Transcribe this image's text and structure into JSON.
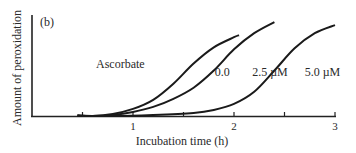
{
  "chart_data": {
    "type": "line",
    "panel_label": "(b)",
    "title": "",
    "xlabel": "Incubation time (h)",
    "ylabel": "Amount of peroxidation",
    "xlim": [
      0,
      3
    ],
    "ylim": [
      0,
      100
    ],
    "x_ticks": [
      0.5,
      1,
      1.5,
      2,
      2.5,
      3
    ],
    "x_tick_labels": [
      {
        "value": 1,
        "label": "1"
      },
      {
        "value": 2,
        "label": "2"
      },
      {
        "value": 3,
        "label": "3"
      }
    ],
    "y_ticks": [],
    "grid": false,
    "legend_title": "Ascorbate",
    "series": [
      {
        "name": "0.0",
        "label": "0.0",
        "x": [
          0.6,
          0.8,
          1.0,
          1.2,
          1.4,
          1.6,
          1.8,
          2.0,
          2.05
        ],
        "y": [
          0,
          2,
          7,
          16,
          32,
          52,
          68,
          78,
          80
        ]
      },
      {
        "name": "2.5 µM",
        "label": "2.5 µM",
        "x": [
          0.6,
          0.8,
          1.0,
          1.2,
          1.4,
          1.6,
          1.8,
          2.0,
          2.2,
          2.4
        ],
        "y": [
          0,
          1,
          4,
          9,
          17,
          28,
          45,
          66,
          82,
          93
        ]
      },
      {
        "name": "5.0 µM",
        "label": "5.0 µM",
        "x": [
          0.8,
          1.2,
          1.6,
          1.8,
          2.0,
          2.2,
          2.4,
          2.6,
          2.8,
          3.0
        ],
        "y": [
          0,
          1,
          3,
          6,
          12,
          24,
          45,
          67,
          82,
          90
        ]
      }
    ],
    "series_label_positions": [
      {
        "series": "0.0",
        "x": 1.81,
        "y": 53
      },
      {
        "series": "2.5 µM",
        "x": 2.18,
        "y": 53
      },
      {
        "series": "5.0 µM",
        "x": 2.7,
        "y": 53
      }
    ]
  }
}
